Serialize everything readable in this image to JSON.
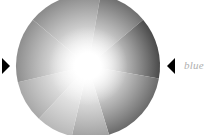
{
  "wheel": {
    "center": [
      88,
      66
    ],
    "radius": 72,
    "center_color": "#ffffff",
    "segments": [
      {
        "start": -50,
        "end": 10,
        "edge_color": "#8a8a8a"
      },
      {
        "start": 10,
        "end": 50,
        "edge_color": "#6f6f6f"
      },
      {
        "start": 50,
        "end": 100,
        "edge_color": "#4a4a4a"
      },
      {
        "start": 100,
        "end": 163,
        "edge_color": "#6a6a6a"
      },
      {
        "start": 163,
        "end": 193,
        "edge_color": "#a0a0a0"
      },
      {
        "start": 193,
        "end": 223,
        "edge_color": "#b8b8b8"
      },
      {
        "start": 223,
        "end": 257,
        "edge_color": "#a8a8a8"
      },
      {
        "start": 257,
        "end": 310,
        "edge_color": "#8e8e8e"
      }
    ]
  },
  "markers": {
    "left_marker": "triangle-right",
    "right_marker": "triangle-left",
    "color": "#000000"
  },
  "label": {
    "text": "blue",
    "color": "#b0b0b0"
  }
}
